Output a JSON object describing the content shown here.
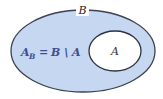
{
  "diagram": {
    "type": "venn-set-difference",
    "outer_set": {
      "label": "B",
      "fill": "#c6d7f1",
      "stroke": "#3c4250"
    },
    "inner_set": {
      "label": "A",
      "fill": "#ffffff",
      "stroke": "#2e3340"
    },
    "formula": {
      "lhs_main": "A",
      "lhs_sub": "B",
      "equals": "=",
      "rhs": "B \\ A",
      "color": "#3d4f96"
    }
  }
}
